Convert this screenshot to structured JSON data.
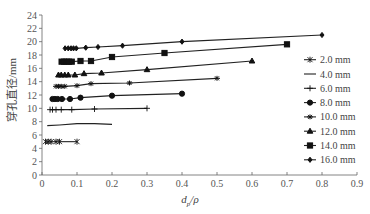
{
  "chart_data": {
    "type": "line",
    "title": "",
    "xlabel": "d_p/ρ",
    "xlabel_main": "d",
    "xlabel_sub": "p",
    "xlabel_tail": "/ρ",
    "ylabel": "穿孔直径/mm",
    "xlim": [
      0,
      0.9
    ],
    "ylim": [
      0,
      24
    ],
    "x_ticks": [
      "0",
      "0.1",
      "0.2",
      "0.3",
      "0.4",
      "0.5",
      "0.6",
      "0.7",
      "0.8",
      "0.9"
    ],
    "y_ticks": [
      "0",
      "2",
      "4",
      "6",
      "8",
      "10",
      "12",
      "14",
      "16",
      "18",
      "20",
      "22",
      "24"
    ],
    "grid": false,
    "legend_position": "right",
    "series": [
      {
        "name": "2.0 mm",
        "marker": "asterisk",
        "x": [
          0.01,
          0.018,
          0.026,
          0.04,
          0.05,
          0.1
        ],
        "y": [
          5.0,
          5.0,
          5.0,
          5.0,
          5.0,
          5.0
        ]
      },
      {
        "name": "4.0 mm",
        "marker": "none",
        "x": [
          0.015,
          0.05,
          0.1,
          0.15,
          0.2
        ],
        "y": [
          7.4,
          7.5,
          7.7,
          7.7,
          7.6
        ]
      },
      {
        "name": "6.0 mm",
        "marker": "plus",
        "x": [
          0.023,
          0.03,
          0.04,
          0.055,
          0.085,
          0.15,
          0.3
        ],
        "y": [
          9.8,
          9.8,
          9.8,
          9.8,
          9.8,
          9.9,
          10.0
        ]
      },
      {
        "name": "8.0 mm",
        "marker": "circle",
        "x": [
          0.03,
          0.037,
          0.045,
          0.057,
          0.08,
          0.11,
          0.2,
          0.4
        ],
        "y": [
          11.4,
          11.4,
          11.4,
          11.4,
          11.4,
          11.6,
          11.9,
          12.2
        ]
      },
      {
        "name": "10.0 mm",
        "marker": "star",
        "x": [
          0.04,
          0.047,
          0.055,
          0.065,
          0.1,
          0.14,
          0.25,
          0.5
        ],
        "y": [
          13.3,
          13.3,
          13.3,
          13.3,
          13.4,
          13.7,
          13.8,
          14.5
        ]
      },
      {
        "name": "12.0 mm",
        "marker": "triangle",
        "x": [
          0.047,
          0.055,
          0.065,
          0.075,
          0.094,
          0.12,
          0.17,
          0.3,
          0.6
        ],
        "y": [
          15.0,
          15.0,
          15.0,
          15.0,
          15.0,
          15.2,
          15.3,
          15.8,
          17.1
        ]
      },
      {
        "name": "14.0 mm",
        "marker": "square",
        "x": [
          0.056,
          0.063,
          0.07,
          0.077,
          0.085,
          0.11,
          0.14,
          0.2,
          0.35,
          0.7
        ],
        "y": [
          17.0,
          17.0,
          17.0,
          17.0,
          17.0,
          17.1,
          17.1,
          17.7,
          18.3,
          19.6
        ]
      },
      {
        "name": "16.0 mm",
        "marker": "diamond",
        "x": [
          0.066,
          0.075,
          0.083,
          0.09,
          0.098,
          0.125,
          0.16,
          0.23,
          0.4,
          0.8
        ],
        "y": [
          19.0,
          19.0,
          19.0,
          19.0,
          19.0,
          19.1,
          19.2,
          19.4,
          20.0,
          21.0
        ]
      }
    ]
  }
}
